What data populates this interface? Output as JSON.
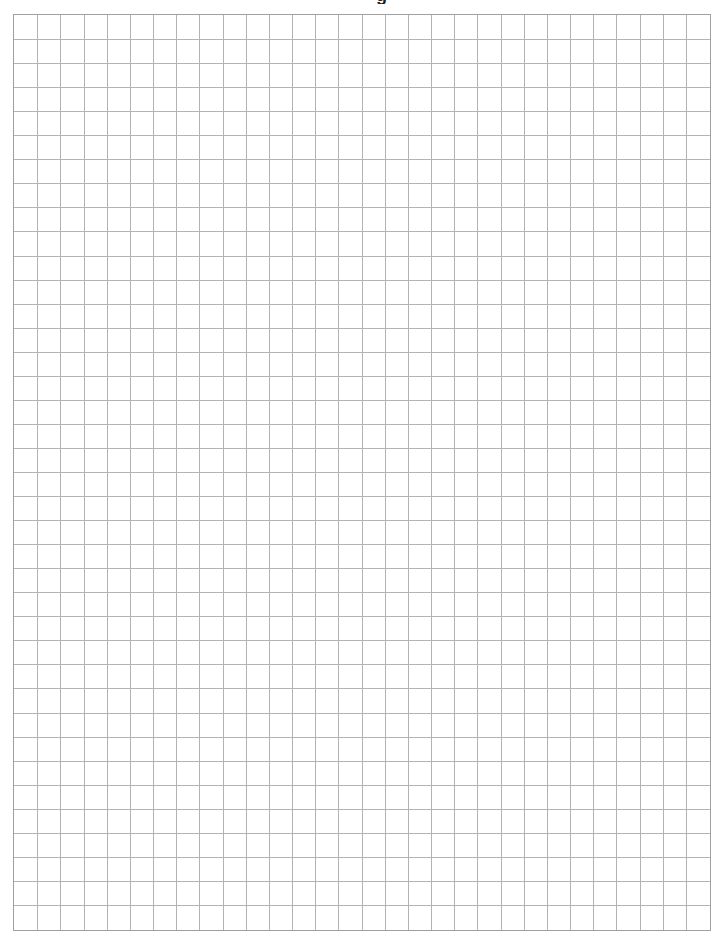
{
  "page": {
    "type": "graph-paper",
    "header_fragment": "g",
    "grid": {
      "columns": 30,
      "rows": 38,
      "line_color": "#b3b3b3",
      "border_color": "#a0a0a0",
      "background": "#ffffff"
    }
  }
}
